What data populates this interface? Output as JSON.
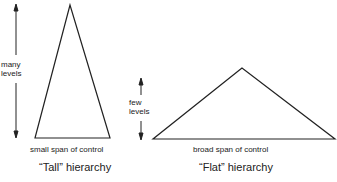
{
  "tall": {
    "levels_label_1": "many",
    "levels_label_2": "levels",
    "span_label": "small span of control",
    "caption": "“Tall” hierarchy"
  },
  "flat": {
    "levels_label_1": "few",
    "levels_label_2": "levels",
    "span_label": "broad span of control",
    "caption": "“Flat” hierarchy"
  },
  "colors": {
    "stroke": "#222222",
    "background": "#ffffff"
  }
}
